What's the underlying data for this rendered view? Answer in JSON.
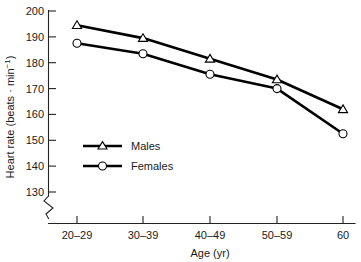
{
  "chart_data": {
    "type": "line",
    "title": "",
    "xlabel": "Age (yr)",
    "ylabel": "Heart rate (beats · min−1)",
    "categories": [
      "20–29",
      "30–39",
      "40–49",
      "50–59",
      "60"
    ],
    "series": [
      {
        "name": "Males",
        "marker": "triangle",
        "values": [
          194.5,
          189.5,
          181.5,
          173.5,
          162.0
        ]
      },
      {
        "name": "Females",
        "marker": "circle",
        "values": [
          187.5,
          183.5,
          175.5,
          170.0,
          152.5
        ]
      }
    ],
    "ylim": [
      130,
      200
    ],
    "yticks": [
      130,
      140,
      150,
      160,
      170,
      180,
      190,
      200
    ],
    "ytick_labels": [
      "130",
      "140",
      "150",
      "160",
      "170",
      "180",
      "190",
      "200"
    ],
    "xtick_labels": [
      "20–29",
      "30–39",
      "40–49",
      "50–59",
      "60"
    ],
    "grid": false,
    "legend_position": "inside-lower-left",
    "axis_break": true,
    "axis_break_note": "zigzag break on y-axis below 130"
  },
  "axes": {
    "y_title": "Heart rate (beats · min−1)",
    "y_title_main": "Heart rate (beats · min",
    "y_title_exponent": "−1",
    "y_title_close": ")",
    "x_title": "Age (yr)"
  },
  "legend": {
    "entries": [
      {
        "label": "Males"
      },
      {
        "label": "Females"
      }
    ]
  }
}
